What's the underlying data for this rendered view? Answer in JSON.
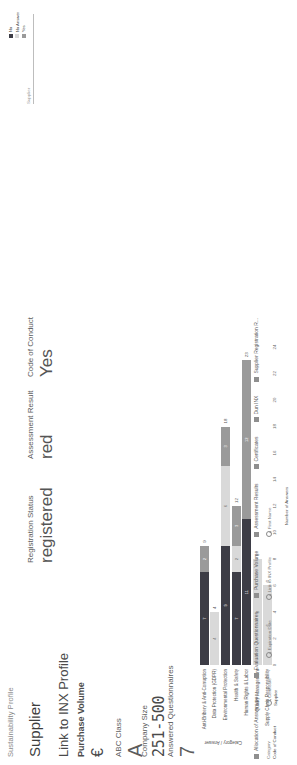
{
  "app": {
    "breadcrumb": "Sustainability Profile"
  },
  "kpis": [
    {
      "label": "Supplier",
      "value": ""
    },
    {
      "label": "Link to INX Profile",
      "value": ""
    },
    {
      "label": "Purchase Volume",
      "value": "€"
    },
    {
      "label": "ABC Class",
      "value": "A"
    },
    {
      "label": "Company Size",
      "value": "251-500"
    },
    {
      "label": "Answered Questionnaires",
      "value": "7"
    },
    {
      "label": "Registration Status",
      "value": "registered"
    },
    {
      "label": "Assessment Result",
      "value": "red"
    },
    {
      "label": "Code of Conduct",
      "value": "Yes"
    }
  ],
  "topbar": {
    "label": "Supplier"
  },
  "tabs": [
    {
      "icon": "bar-chart-icon",
      "label": "Allocation of Answers pe..."
    },
    {
      "icon": "grid-icon",
      "label": "Evaluation Questionnaires"
    },
    {
      "icon": "bar-chart-icon",
      "label": "Purchase Volume"
    },
    {
      "icon": "grid-icon",
      "label": "Assessment Results"
    },
    {
      "icon": "grid-icon",
      "label": "Certificates"
    },
    {
      "icon": "grid-icon",
      "label": "Dun INX"
    },
    {
      "icon": "grid-icon",
      "label": "Supplier Registration R..."
    }
  ],
  "filters": [
    {
      "name": "Category",
      "value": "Code of Conduct",
      "icon": ""
    },
    {
      "name": "Certificate",
      "value": "Supplier",
      "icon": "search-icon"
    },
    {
      "name": "Expiration Date",
      "value": "",
      "icon": "search-icon"
    },
    {
      "name": "Link to INX Profile",
      "value": "",
      "icon": "search-icon"
    },
    {
      "name": "First Name",
      "value": "",
      "icon": "search-icon"
    }
  ],
  "colors": {
    "no": "#3d3d46",
    "no_answer": "#d9d9d9",
    "yes": "#9a9a9a",
    "axis": "#666666"
  },
  "chart_data": {
    "type": "bar",
    "orientation": "horizontal",
    "stacked": true,
    "title": "",
    "xlabel": "Number of Answers",
    "ylabel": "Category / Answer",
    "xlim": [
      0,
      24
    ],
    "xticks": [
      0,
      2,
      4,
      6,
      8,
      10,
      12,
      14,
      16,
      18,
      20,
      22,
      24
    ],
    "grid": false,
    "legend_position": "top-right",
    "legend": [
      "No",
      "No Answer",
      "Yes"
    ],
    "categories": [
      "Anti-Bribery & Anti-Corruption",
      "Data Protection (GDPR)",
      "Environmental Protection",
      "Health & Safety",
      "Human Rights & Labor",
      "Quality Management",
      "Supply Chain Responsibility"
    ],
    "series": [
      {
        "name": "No",
        "color": "#3d3d46",
        "values": [
          7,
          0,
          9,
          7,
          11,
          0,
          0
        ]
      },
      {
        "name": "No Answer",
        "color": "#d9d9d9",
        "values": [
          0,
          4,
          6,
          2,
          0,
          8,
          6
        ]
      },
      {
        "name": "Yes",
        "color": "#9a9a9a",
        "values": [
          2,
          0,
          3,
          3,
          12,
          0,
          0
        ]
      }
    ],
    "totals": [
      9,
      4,
      18,
      12,
      23,
      8,
      6
    ],
    "bar_value_labels": {
      "Anti-Bribery & Anti-Corruption": {
        "Yes": 2,
        "No": 7,
        "total": 9
      },
      "Data Protection (GDPR)": {
        "No Answer": 4,
        "total": 4
      },
      "Environmental Protection": {
        "Yes": 3,
        "No Answer": 6,
        "No": 9,
        "total": 18
      },
      "Health & Safety": {
        "Yes": 3,
        "No Answer": 2,
        "No": 7,
        "total": 12
      },
      "Human Rights & Labor": {
        "Yes": 12,
        "No": 11,
        "total": 23
      },
      "Quality Management": {
        "No Answer": 8,
        "total": 8
      },
      "Supply Chain Responsibility": {
        "No Answer": 6,
        "total": 6
      }
    }
  }
}
